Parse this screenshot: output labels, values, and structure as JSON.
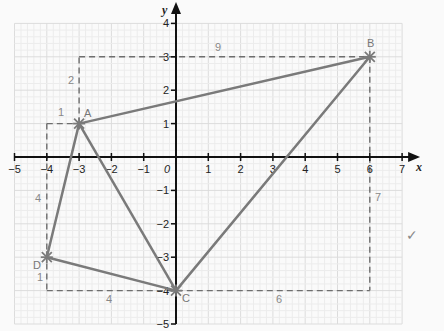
{
  "diagram": {
    "axes": {
      "x_label": "x",
      "y_label": "y",
      "origin_label": "0",
      "x_range": [
        -5,
        7
      ],
      "y_range": [
        -5,
        4
      ],
      "x_ticks": [
        "-5",
        "-4",
        "-3",
        "-2",
        "-1",
        "1",
        "2",
        "3",
        "4",
        "5",
        "6",
        "7"
      ],
      "y_ticks": [
        "4",
        "3",
        "2",
        "1",
        "-1",
        "-2",
        "-3",
        "-4",
        "-5"
      ]
    },
    "points": [
      {
        "name": "A",
        "x": -3,
        "y": 1
      },
      {
        "name": "B",
        "x": 6,
        "y": 3
      },
      {
        "name": "C",
        "x": 0,
        "y": -4
      },
      {
        "name": "D",
        "x": -4,
        "y": -3
      }
    ],
    "quadrilateral": [
      "A",
      "B",
      "C",
      "D"
    ],
    "bounding_rectangle": {
      "x_min": -4,
      "x_max": 6,
      "y_min": -4,
      "y_max": 3
    },
    "segment_lengths": [
      {
        "label": "9",
        "note": "top dashed, from x=-3 to 6 at y=3"
      },
      {
        "label": "2",
        "note": "vertical dashed from A up to y=3"
      },
      {
        "label": "1",
        "note": "horizontal dashed from x=-4 to A at y=1"
      },
      {
        "label": "4",
        "note": "vertical dashed from y=1 down to D"
      },
      {
        "label": "1",
        "note": "vertical dashed from D down to y=-4"
      },
      {
        "label": "4",
        "note": "horizontal dashed from x=-4 to C at y=-4"
      },
      {
        "label": "6",
        "note": "horizontal dashed from C to x=6 at y=-4"
      },
      {
        "label": "7",
        "note": "vertical dashed from B down to y=-4"
      }
    ],
    "annotation": "✓",
    "colors": {
      "shape_line": "#7a7a7a",
      "dashed_line": "#6e6e6e",
      "axis": "#111111",
      "grid_major": "#dcdcdc",
      "grid_minor": "#ececec"
    }
  },
  "text": {
    "A": "A",
    "B": "B",
    "C": "C",
    "D": "D",
    "len_top": "9",
    "len_a_up": "2",
    "len_a_left": "1",
    "len_d_up": "4",
    "len_d_down": "1",
    "len_bottom_left": "4",
    "len_bottom_right": "6",
    "len_right": "7",
    "check": "✓"
  }
}
